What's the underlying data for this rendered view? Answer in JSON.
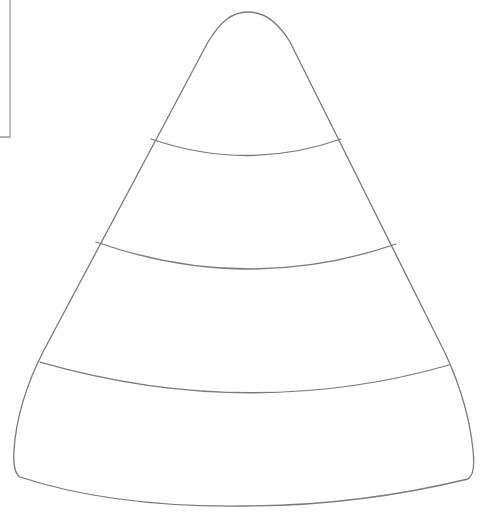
{
  "drawing": {
    "subject": "candy corn outline",
    "stroke_color": "#7a7a7a",
    "background_color": "#ffffff",
    "bands": 4,
    "band_labels": [
      "tip",
      "upper-middle",
      "lower-middle",
      "base"
    ]
  },
  "frame": {
    "stroke_color": "#9a9a9a"
  }
}
